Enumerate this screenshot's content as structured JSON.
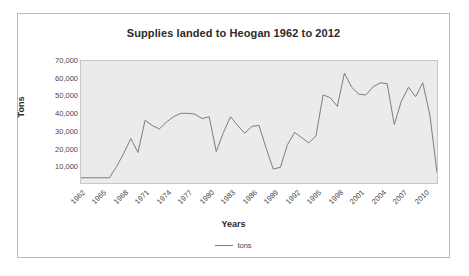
{
  "chart_data": {
    "type": "line",
    "title": "Supplies landed to Heogan 1962 to 2012",
    "xlabel": "Years",
    "ylabel": "Tons",
    "ylim": [
      0,
      70000
    ],
    "ytick_step": 10000,
    "ytick_labels": [
      "70,000",
      "60,000",
      "50,000",
      "40,000",
      "30,000",
      "20,000",
      "10,000"
    ],
    "ytick_values": [
      70000,
      60000,
      50000,
      40000,
      30000,
      20000,
      10000
    ],
    "xtick_labels": [
      "1962",
      "1965",
      "1968",
      "1971",
      "1974",
      "1977",
      "1980",
      "1983",
      "1986",
      "1989",
      "1992",
      "1995",
      "1998",
      "2001",
      "2004",
      "2007",
      "2010"
    ],
    "xtick_values": [
      1962,
      1965,
      1968,
      1971,
      1974,
      1977,
      1980,
      1983,
      1986,
      1989,
      1992,
      1995,
      1998,
      2001,
      2004,
      2007,
      2010
    ],
    "xlim": [
      1962,
      2012
    ],
    "grid": false,
    "legend_position": "bottom",
    "plot_background": "#ebebeb",
    "line_color": "#7d7d7d",
    "series": [
      {
        "name": "tons",
        "x": [
          1962,
          1963,
          1964,
          1965,
          1966,
          1967,
          1968,
          1969,
          1970,
          1971,
          1972,
          1973,
          1974,
          1975,
          1976,
          1977,
          1978,
          1979,
          1980,
          1981,
          1982,
          1983,
          1984,
          1985,
          1986,
          1987,
          1988,
          1989,
          1990,
          1991,
          1992,
          1993,
          1994,
          1995,
          1996,
          1997,
          1998,
          1999,
          2000,
          2001,
          2002,
          2003,
          2004,
          2005,
          2006,
          2007,
          2008,
          2009,
          2010,
          2011,
          2012
        ],
        "values": [
          3000,
          3000,
          3000,
          3000,
          3000,
          9500,
          17000,
          25500,
          17500,
          36000,
          33000,
          31000,
          35000,
          38000,
          40000,
          40000,
          39500,
          37000,
          38000,
          18000,
          29000,
          38000,
          33000,
          28500,
          32500,
          33000,
          20000,
          8000,
          9000,
          22000,
          29000,
          26000,
          23000,
          27000,
          50500,
          49000,
          44000,
          63000,
          55000,
          51000,
          50500,
          55000,
          57500,
          57000,
          33500,
          47000,
          55000,
          49500,
          57500,
          39000,
          6000
        ]
      }
    ]
  },
  "legend": {
    "label": "tons"
  }
}
